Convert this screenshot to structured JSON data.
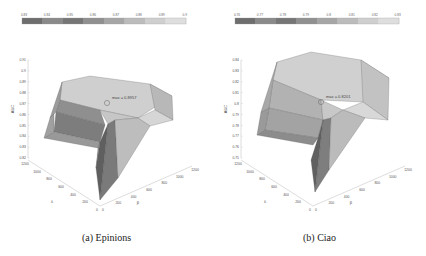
{
  "chart_data": [
    {
      "type": "surface3d",
      "title": "(a)  Epinions",
      "zlabel": "AUC",
      "xlabel": "λ",
      "ylabel": "β",
      "x_ticks": [
        "0",
        "200",
        "400",
        "600",
        "800",
        "1000",
        "1200"
      ],
      "y_ticks": [
        "0",
        "200",
        "400",
        "600",
        "800",
        "1000",
        "1200"
      ],
      "z_ticks": [
        "0.82",
        "0.83",
        "0.84",
        "0.85",
        "0.86",
        "0.87",
        "0.88",
        "0.89",
        "0.9",
        "0.91"
      ],
      "zlim": [
        0.82,
        0.91
      ],
      "colorbar_ticks": [
        "0.83",
        "0.84",
        "0.85",
        "0.86",
        "0.87",
        "0.88",
        "0.89",
        "0.9"
      ],
      "annotation": "max = 0.8957",
      "max_value": 0.8957
    },
    {
      "type": "surface3d",
      "title": "(b)  Ciao",
      "zlabel": "AUC",
      "xlabel": "λ",
      "ylabel": "β",
      "x_ticks": [
        "0",
        "200",
        "400",
        "600",
        "800",
        "1000",
        "1200"
      ],
      "y_ticks": [
        "0",
        "200",
        "400",
        "600",
        "800",
        "1000",
        "1200"
      ],
      "z_ticks": [
        "0.75",
        "0.76",
        "0.77",
        "0.78",
        "0.79",
        "0.8",
        "0.81",
        "0.82",
        "0.83",
        "0.84"
      ],
      "zlim": [
        0.75,
        0.84
      ],
      "colorbar_ticks": [
        "0.76",
        "0.77",
        "0.78",
        "0.79",
        "0.8",
        "0.81",
        "0.82",
        "0.83"
      ],
      "annotation": "max = 0.8201",
      "max_value": 0.8201
    }
  ],
  "captions": {
    "left": "(a)  Epinions",
    "right": "(b)  Ciao"
  },
  "colors": {
    "colorbar": [
      "#6e6e6e",
      "#8a8a8a",
      "#767676",
      "#909090",
      "#a6a6a6",
      "#bcbcbc",
      "#cfcfcf",
      "#dedede"
    ]
  }
}
